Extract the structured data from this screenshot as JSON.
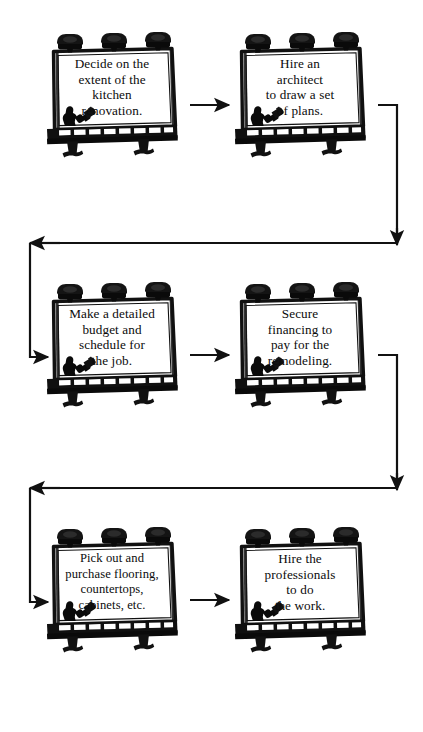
{
  "diagram": {
    "type": "flowchart",
    "orientation": "serpentine-left-to-right",
    "node_shape": "billboard-sign",
    "ink_color": "#111111",
    "panel_color": "#ffffff",
    "background_color": "#ffffff",
    "rows": 3,
    "columns": 2
  },
  "nodes": [
    {
      "id": "step-1",
      "order": 1,
      "row": 1,
      "column": 1,
      "text": "Decide on the\nextent of the\nkitchen\nrenovation.",
      "lines": [
        "Decide on the",
        "extent of the",
        "kitchen",
        "renovation."
      ]
    },
    {
      "id": "step-2",
      "order": 2,
      "row": 1,
      "column": 2,
      "text": "Hire an\narchitect\nto draw a set\nof plans.",
      "lines": [
        "Hire an",
        "architect",
        "to draw a set",
        "of plans."
      ]
    },
    {
      "id": "step-3",
      "order": 3,
      "row": 2,
      "column": 1,
      "text": "Make a detailed\nbudget and\nschedule for\nthe job.",
      "lines": [
        "Make a detailed",
        "budget and",
        "schedule for",
        "the job."
      ]
    },
    {
      "id": "step-4",
      "order": 4,
      "row": 2,
      "column": 2,
      "text": "Secure\nfinancing to\npay for the\nremodeling.",
      "lines": [
        "Secure",
        "financing to",
        "pay for the",
        "remodeling."
      ]
    },
    {
      "id": "step-5",
      "order": 5,
      "row": 3,
      "column": 1,
      "text": "Pick out and\npurchase flooring,\ncountertops,\ncabinets, etc.",
      "lines": [
        "Pick out and",
        "purchase flooring,",
        "countertops,",
        "cabinets, etc."
      ]
    },
    {
      "id": "step-6",
      "order": 6,
      "row": 3,
      "column": 2,
      "text": "Hire the\nprofessionals\nto do\nthe work.",
      "lines": [
        "Hire the",
        "professionals",
        "to do",
        "the work."
      ]
    }
  ],
  "connectors": [
    {
      "id": "c1",
      "from": "step-1",
      "to": "step-2",
      "style": "straight-horizontal",
      "direction": "right"
    },
    {
      "id": "c2",
      "from": "step-2",
      "to": "step-3",
      "style": "wrap-down-left",
      "direction": "down-left-down-right"
    },
    {
      "id": "c3",
      "from": "step-3",
      "to": "step-4",
      "style": "straight-horizontal",
      "direction": "right"
    },
    {
      "id": "c4",
      "from": "step-4",
      "to": "step-5",
      "style": "wrap-down-left",
      "direction": "down-left-down-right"
    },
    {
      "id": "c5",
      "from": "step-5",
      "to": "step-6",
      "style": "straight-horizontal",
      "direction": "right"
    }
  ],
  "sign_art": {
    "lamp_count": 3,
    "leg_count": 2,
    "catwalk_segments": 8,
    "worker": "painter-silhouette-with-roller"
  }
}
